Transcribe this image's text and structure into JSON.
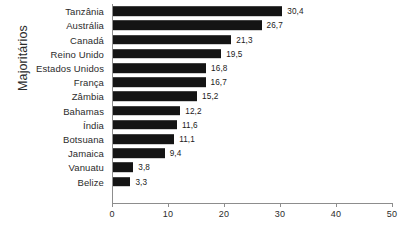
{
  "chart_data": {
    "type": "bar",
    "orientation": "horizontal",
    "title": "",
    "xlabel": "",
    "ylabel": "Majoritários",
    "categories": [
      "Tanzânia",
      "Austrália",
      "Canadá",
      "Reino Unido",
      "Estados Unidos",
      "França",
      "Zâmbia",
      "Bahamas",
      "Índia",
      "Botsuana",
      "Jamaica",
      "Vanuatu",
      "Belize"
    ],
    "values": [
      30.4,
      26.7,
      21.3,
      19.5,
      16.8,
      16.7,
      15.2,
      12.2,
      11.6,
      11.1,
      9.4,
      3.8,
      3.3
    ],
    "value_labels": [
      "30,4",
      "26,7",
      "21,3",
      "19,5",
      "16,8",
      "16,7",
      "15,2",
      "12,2",
      "11,6",
      "11,1",
      "9,4",
      "3,8",
      "3,3"
    ],
    "xlim": [
      0,
      50
    ],
    "xticks": [
      0,
      10,
      20,
      30,
      40,
      50
    ],
    "xtick_labels": [
      "0",
      "10",
      "20",
      "30",
      "40",
      "50"
    ],
    "grid": false,
    "legend": false,
    "bar_color": "#141414",
    "axis_color": "#8d8d8d",
    "background_color": "#ffffff"
  }
}
